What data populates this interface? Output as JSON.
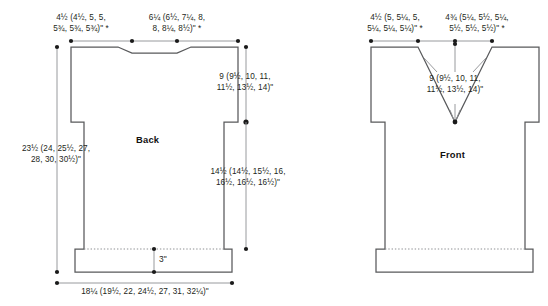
{
  "diagram": {
    "kind": "garment-schematic",
    "units": "inches",
    "line_color": "#58595b",
    "dim_color": "#8d8f92",
    "text_color": "#231f20",
    "background": "#ffffff"
  },
  "back": {
    "title": "Back",
    "shoulder_width": "4½ (4½, 5, 5,\n5¾, 5¾, 5¾)\" *",
    "neck_width": "6¼ (6½, 7¼, 8,\n8, 8¼, 8½)\" *",
    "armhole_depth": "9 (9½, 10, 11,\n11½, 13½, 14)\"",
    "total_length": "23½ (24, 25½, 27,\n28, 30, 30½)\"",
    "body_length": "14½ (14½, 15½, 16,\n16½, 16½, 16½)\"",
    "hem_depth": "3\"",
    "bottom_width": "18¼ (19½, 22, 24½, 27, 31, 32¼)\""
  },
  "front": {
    "title": "Front",
    "shoulder_width": "4½ (5, 5¼, 5,\n5¼, 5¼, 5¼)\" *",
    "neck_width": "4¾ (5¼, 5½, 5¼,\n5½, 5½, 5½)\" *",
    "neck_depth": "9 (9½, 10, 11,\n11½, 13½, 14)\""
  }
}
